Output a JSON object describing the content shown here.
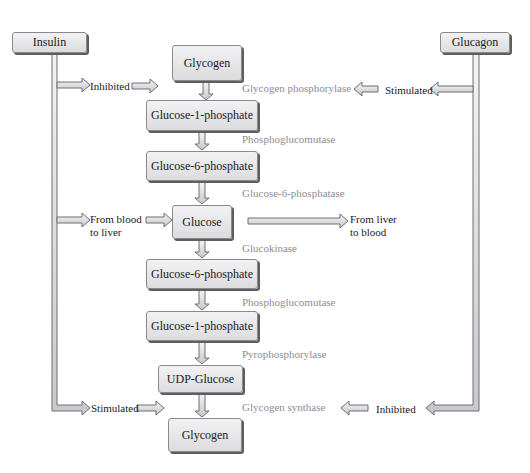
{
  "regulators": {
    "insulin": "Insulin",
    "glucagon": "Glucagon"
  },
  "pathway": [
    {
      "id": "glycogen_top",
      "label": "Glycogen"
    },
    {
      "id": "g1p_1",
      "label": "Glucose-1-phosphate"
    },
    {
      "id": "g6p_1",
      "label": "Glucose-6-phosphate"
    },
    {
      "id": "glucose",
      "label": "Glucose"
    },
    {
      "id": "g6p_2",
      "label": "Glucose-6-phosphate"
    },
    {
      "id": "g1p_2",
      "label": "Glucose-1-phosphate"
    },
    {
      "id": "udp_glucose",
      "label": "UDP-Glucose"
    },
    {
      "id": "glycogen_bottom",
      "label": "Glycogen"
    }
  ],
  "enzymes": [
    "Glycogen phosphorylase",
    "Phosphoglucomutase",
    "Glucose-6-phosphatase",
    "Glucokinase",
    "Phosphoglucomutase",
    "Pyrophosphorylase",
    "Glycogen synthase"
  ],
  "effects": {
    "insulin_top": "Inhibited",
    "insulin_middle_line1": "From blood",
    "insulin_middle_line2": "to liver",
    "insulin_bottom": "Stimulated",
    "glucagon_top": "Stimulated",
    "glucagon_bottom": "Inhibited",
    "glucose_out_line1": "From liver",
    "glucose_out_line2": "to blood"
  },
  "colors": {
    "box_fill": "#e6e6e8",
    "box_shadow": "#5e5e62",
    "enzyme_text": "#8c8c92",
    "arrow_fill": "#e4e4e8",
    "arrow_stroke": "#6e6e74"
  }
}
